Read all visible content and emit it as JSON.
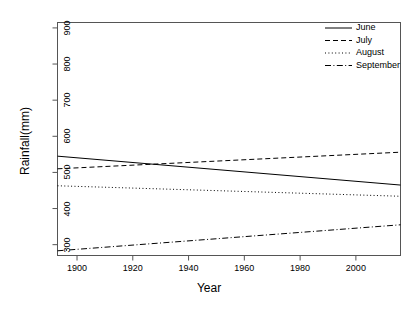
{
  "chart_data": {
    "type": "line",
    "title": "",
    "xlabel": "Year",
    "ylabel": "Rainfall(mm)",
    "xlim": [
      1893,
      2016
    ],
    "ylim": [
      270,
      915
    ],
    "xticks": [
      1900,
      1920,
      1940,
      1960,
      1980,
      2000
    ],
    "yticks": [
      300,
      400,
      500,
      600,
      700,
      800,
      900
    ],
    "grid": false,
    "legend_position": "top-right",
    "x": [
      1893,
      2016
    ],
    "series": [
      {
        "name": "June",
        "linestyle": "solid",
        "color": "#000000",
        "values": [
          545,
          465
        ]
      },
      {
        "name": "July",
        "linestyle": "dashed",
        "color": "#000000",
        "values": [
          510,
          556
        ]
      },
      {
        "name": "August",
        "linestyle": "dotted",
        "color": "#000000",
        "values": [
          463,
          434
        ]
      },
      {
        "name": "September",
        "linestyle": "dashdot",
        "color": "#000000",
        "values": [
          283,
          355
        ]
      }
    ]
  },
  "axes": {
    "xlabel": "Year",
    "ylabel": "Rainfall(mm)",
    "xtick_labels": [
      "1900",
      "1920",
      "1940",
      "1960",
      "1980",
      "2000"
    ],
    "ytick_labels": [
      "300",
      "400",
      "500",
      "600",
      "700",
      "800",
      "900"
    ]
  },
  "legend": {
    "entries": [
      {
        "label": "June"
      },
      {
        "label": "July"
      },
      {
        "label": "August"
      },
      {
        "label": "September"
      }
    ]
  }
}
